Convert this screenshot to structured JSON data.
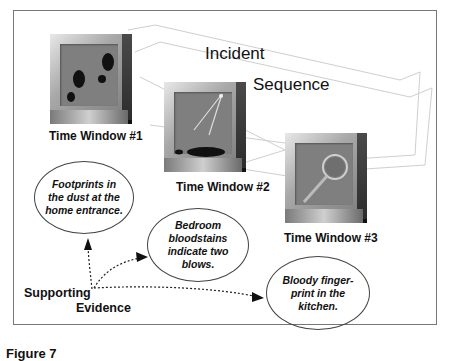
{
  "title": {
    "line1": "Incident",
    "line2": "Sequence"
  },
  "windows": [
    {
      "label": "Time Window #1",
      "icon": "footprints-icon"
    },
    {
      "label": "Time Window #2",
      "icon": "bloodstain-spatter-icon"
    },
    {
      "label": "Time Window #3",
      "icon": "magnifying-glass-icon"
    }
  ],
  "evidence": {
    "label_line1": "Supporting",
    "label_line2": "Evidence",
    "items": [
      {
        "text": "Footprints in the dust at the home entrance."
      },
      {
        "text": "Bedroom bloodstains indicate two blows."
      },
      {
        "text": "Bloody finger-print in the kitchen."
      }
    ]
  },
  "caption": "Figure 7"
}
